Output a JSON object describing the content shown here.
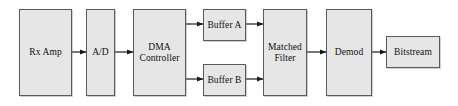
{
  "diagram": {
    "style": {
      "box_fill": "#e6e6e6",
      "box_stroke": "#5a5a5a",
      "line_color": "#1a1a1a",
      "background": "#ffffff"
    },
    "nodes": [
      {
        "id": "rx_amp",
        "label": "Rx Amp",
        "x": 19,
        "y": 9,
        "w": 53,
        "h": 87
      },
      {
        "id": "ad",
        "label": "A/D",
        "x": 86,
        "y": 9,
        "w": 29,
        "h": 87
      },
      {
        "id": "dma",
        "label": "DMA\nController",
        "x": 133,
        "y": 9,
        "w": 53,
        "h": 87
      },
      {
        "id": "buffer_a",
        "label": "Buffer A",
        "x": 203,
        "y": 9,
        "w": 43,
        "h": 32
      },
      {
        "id": "buffer_b",
        "label": "Buffer B",
        "x": 203,
        "y": 64,
        "w": 43,
        "h": 32
      },
      {
        "id": "matched_filter",
        "label": "Matched\nFilter",
        "x": 263,
        "y": 9,
        "w": 44,
        "h": 87
      },
      {
        "id": "demod",
        "label": "Demod",
        "x": 326,
        "y": 9,
        "w": 46,
        "h": 87
      },
      {
        "id": "bitstream",
        "label": "Bitstream",
        "x": 386,
        "y": 36,
        "w": 54,
        "h": 32
      }
    ],
    "edges": [
      {
        "id": "rx_amp-to-ad",
        "from": "rx_amp",
        "to": "ad",
        "x1": 72,
        "y1": 52,
        "x2": 86,
        "y2": 52
      },
      {
        "id": "ad-to-dma",
        "from": "ad",
        "to": "dma",
        "x1": 115,
        "y1": 52,
        "x2": 133,
        "y2": 52
      },
      {
        "id": "dma-to-buffer-a",
        "from": "dma",
        "to": "buffer_a",
        "x1": 186,
        "y1": 24,
        "x2": 203,
        "y2": 24
      },
      {
        "id": "dma-to-buffer-b",
        "from": "dma",
        "to": "buffer_b",
        "x1": 186,
        "y1": 79,
        "x2": 203,
        "y2": 79
      },
      {
        "id": "buffer-a-to-filter",
        "from": "buffer_a",
        "to": "matched_filter",
        "x1": 246,
        "y1": 24,
        "x2": 263,
        "y2": 24
      },
      {
        "id": "buffer-b-to-filter",
        "from": "buffer_b",
        "to": "matched_filter",
        "x1": 246,
        "y1": 79,
        "x2": 263,
        "y2": 79
      },
      {
        "id": "filter-to-demod",
        "from": "matched_filter",
        "to": "demod",
        "x1": 307,
        "y1": 52,
        "x2": 326,
        "y2": 52
      },
      {
        "id": "demod-to-bitstream",
        "from": "demod",
        "to": "bitstream",
        "x1": 372,
        "y1": 52,
        "x2": 386,
        "y2": 52
      }
    ]
  }
}
